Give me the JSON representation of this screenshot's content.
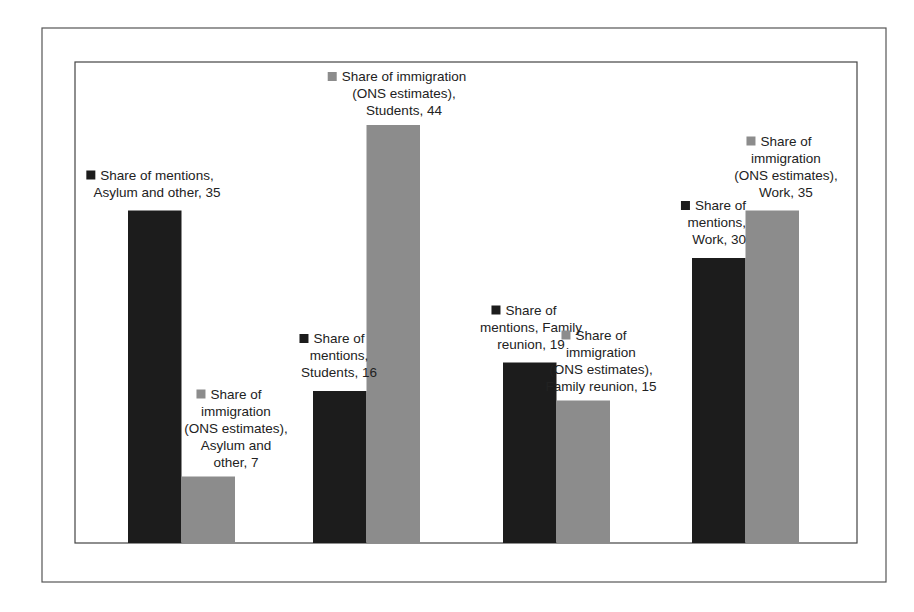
{
  "chart_data": {
    "type": "bar",
    "title": "",
    "xlabel": "",
    "ylabel": "",
    "ylim": [
      0,
      50
    ],
    "grid": false,
    "legend": "none (series identified by inline data labels)",
    "categories": [
      "Asylum and other",
      "Students",
      "Family reunion",
      "Work"
    ],
    "series": [
      {
        "name": "Share of mentions",
        "color": "#1c1c1c",
        "values": [
          35,
          16,
          19,
          30
        ],
        "labels": [
          [
            "Share of mentions,",
            "Asylum and other, 35"
          ],
          [
            "Share of",
            "mentions,",
            "Students, 16"
          ],
          [
            "Share of",
            "mentions, Family",
            "reunion, 19"
          ],
          [
            "Share of",
            "mentions,",
            "Work, 30"
          ]
        ]
      },
      {
        "name": "Share of immigration (ONS estimates)",
        "color": "#8c8c8c",
        "values": [
          7,
          44,
          15,
          35
        ],
        "labels": [
          [
            "Share of",
            "immigration",
            "(ONS estimates),",
            "Asylum and",
            "other, 7"
          ],
          [
            "Share of immigration",
            "(ONS estimates),",
            "Students, 44"
          ],
          [
            "Share of",
            "immigration",
            "(ONS estimates),",
            "Family reunion, 15"
          ],
          [
            "Share of",
            "immigration",
            "(ONS estimates),",
            "Work, 35"
          ]
        ]
      }
    ]
  }
}
